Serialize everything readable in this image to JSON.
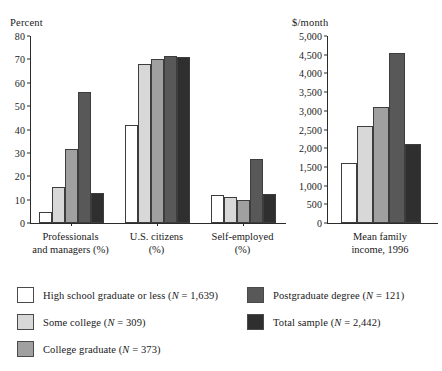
{
  "series_colors": {
    "hs_or_less": "#ffffff",
    "some_college": "#d8d8d8",
    "college_graduate": "#a0a0a0",
    "postgraduate": "#585858",
    "total_sample": "#2f2f2f"
  },
  "left_chart": {
    "unit_label": "Percent",
    "ylabel": "",
    "yticks": [
      "0",
      "10",
      "20",
      "30",
      "40",
      "50",
      "60",
      "70",
      "80"
    ],
    "categories": [
      "Professionals\nand managers (%)",
      "U.S. citizens\n(%)",
      "Self-employed\n(%)"
    ]
  },
  "right_chart": {
    "unit_label": "$/month",
    "yticks": [
      "0",
      "500",
      "1,000",
      "1,500",
      "2,000",
      "2,500",
      "3,000",
      "3,500",
      "4,000",
      "4,500",
      "5,000"
    ],
    "categories": [
      "Mean family\nincome, 1996"
    ]
  },
  "legend": {
    "items": [
      {
        "label": "High school graduate or less (N = 1,639)",
        "color": "#ffffff"
      },
      {
        "label": "Some college (N = 309)",
        "color": "#d8d8d8"
      },
      {
        "label": "College graduate (N = 373)",
        "color": "#a0a0a0"
      },
      {
        "label": "Postgraduate degree (N = 121)",
        "color": "#585858"
      },
      {
        "label": "Total sample (N = 2,442)",
        "color": "#2f2f2f"
      }
    ]
  },
  "chart_data": [
    {
      "type": "bar",
      "title": "",
      "xlabel": "",
      "ylabel": "Percent",
      "ylim": [
        0,
        80
      ],
      "ytick_step": 10,
      "grid": false,
      "legend_position": "bottom",
      "categories": [
        "Professionals and managers (%)",
        "U.S. citizens (%)",
        "Self-employed (%)"
      ],
      "series": [
        {
          "name": "High school graduate or less (N = 1,639)",
          "color": "#ffffff",
          "values": [
            4.5,
            42,
            11.8
          ]
        },
        {
          "name": "Some college (N = 309)",
          "color": "#d8d8d8",
          "values": [
            15.5,
            68,
            11.2
          ]
        },
        {
          "name": "College graduate (N = 373)",
          "color": "#a0a0a0",
          "values": [
            31.5,
            70,
            9.8
          ]
        },
        {
          "name": "Postgraduate degree (N = 121)",
          "color": "#585858",
          "values": [
            56,
            71.5,
            27.3
          ]
        },
        {
          "name": "Total sample (N = 2,442)",
          "color": "#2f2f2f",
          "values": [
            12.8,
            71,
            12.2
          ]
        }
      ]
    },
    {
      "type": "bar",
      "title": "",
      "xlabel": "",
      "ylabel": "$/month",
      "ylim": [
        0,
        5000
      ],
      "ytick_step": 500,
      "grid": false,
      "legend_position": "bottom",
      "categories": [
        "Mean family income, 1996"
      ],
      "series": [
        {
          "name": "High school graduate or less (N = 1,639)",
          "color": "#ffffff",
          "values": [
            1600
          ]
        },
        {
          "name": "Some college (N = 309)",
          "color": "#d8d8d8",
          "values": [
            2600
          ]
        },
        {
          "name": "College graduate (N = 373)",
          "color": "#a0a0a0",
          "values": [
            3100
          ]
        },
        {
          "name": "Postgraduate degree (N = 121)",
          "color": "#585858",
          "values": [
            4550
          ]
        },
        {
          "name": "Total sample (N = 2,442)",
          "color": "#2f2f2f",
          "values": [
            2100
          ]
        }
      ]
    }
  ]
}
